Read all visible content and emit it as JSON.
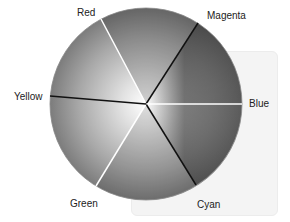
{
  "diagram": {
    "type": "color-wheel",
    "center": [
      146,
      104
    ],
    "radius": 96,
    "segments": [
      {
        "label": "Red",
        "angle_deg": -118,
        "divider_color": "#ffffff"
      },
      {
        "label": "Magenta",
        "angle_deg": -57,
        "divider_color": "#111111"
      },
      {
        "label": "Blue",
        "angle_deg": 0,
        "divider_color": "#ffffff"
      },
      {
        "label": "Cyan",
        "angle_deg": 58,
        "divider_color": "#111111"
      },
      {
        "label": "Green",
        "angle_deg": 121,
        "divider_color": "#ffffff"
      },
      {
        "label": "Yellow",
        "angle_deg": 184,
        "divider_color": "#111111"
      }
    ]
  },
  "labels": {
    "red": "Red",
    "magenta": "Magenta",
    "blue": "Blue",
    "cyan": "Cyan",
    "green": "Green",
    "yellow": "Yellow"
  }
}
